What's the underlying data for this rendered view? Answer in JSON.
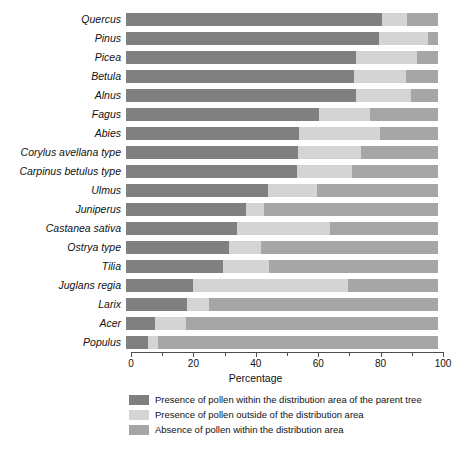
{
  "chart_data": {
    "type": "bar",
    "orientation": "horizontal",
    "stacked": true,
    "stack_mode": "percent",
    "title": "",
    "xlabel": "Percentage",
    "ylabel": "",
    "xlim": [
      0,
      100
    ],
    "xticks": [
      0,
      10,
      20,
      30,
      40,
      50,
      60,
      70,
      80,
      90,
      100
    ],
    "xtick_labels": [
      "0",
      "",
      "20",
      "",
      "40",
      "",
      "60",
      "",
      "80",
      "",
      "100"
    ],
    "grid": false,
    "legend_position": "bottom",
    "categories": [
      "Quercus",
      "Pinus",
      "Picea",
      "Betula",
      "Alnus",
      "Fagus",
      "Abies",
      "Corylus avellana type",
      "Carpinus betulus type",
      "Ulmus",
      "Juniperus",
      "Castanea sativa",
      "Ostrya type",
      "Tilia",
      "Juglans regia",
      "Larix",
      "Acer",
      "Populus"
    ],
    "series": [
      {
        "name": "Presence of pollen within the distribution area of the parent tree",
        "color": "#808080",
        "values": [
          82.0,
          81.0,
          73.6,
          73.0,
          73.6,
          61.7,
          55.5,
          55.2,
          54.7,
          45.6,
          38.4,
          35.5,
          33.1,
          31.2,
          21.6,
          19.5,
          9.3,
          7.2
        ]
      },
      {
        "name": "Presence of pollen outside of the distribution area",
        "color": "#d4d4d4",
        "values": [
          8.0,
          15.7,
          19.8,
          16.7,
          17.6,
          16.5,
          25.8,
          20.1,
          17.6,
          15.5,
          5.8,
          29.9,
          10.2,
          14.6,
          49.6,
          7.2,
          9.9,
          3.2
        ]
      },
      {
        "name": "Absence of pollen within the distribution area",
        "color": "#a6a6a6",
        "values": [
          10.0,
          3.3,
          6.6,
          10.3,
          8.8,
          21.8,
          18.7,
          24.7,
          27.7,
          38.9,
          55.8,
          34.6,
          56.7,
          54.2,
          28.8,
          73.3,
          80.8,
          89.6
        ]
      }
    ],
    "legend": [
      {
        "label": "Presence of pollen within the distribution area of the parent tree",
        "color": "#808080"
      },
      {
        "label": "Presence of pollen outside of the distribution area",
        "color": "#d4d4d4"
      },
      {
        "label": "Absence of pollen within the distribution area",
        "color": "#a6a6a6"
      }
    ]
  }
}
